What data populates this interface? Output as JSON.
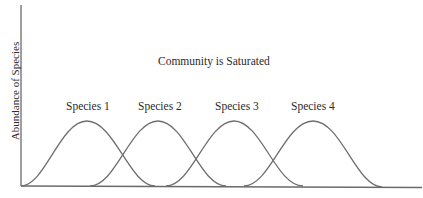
{
  "diagram": {
    "title": "Community is Saturated",
    "y_axis_label": "Abundance of Species",
    "x_axis_label": "",
    "species": [
      {
        "label": "Species 1"
      },
      {
        "label": "Species 2"
      },
      {
        "label": "Species 3"
      },
      {
        "label": "Species 4"
      }
    ],
    "colors": {
      "curve": "#6e6e6e",
      "axis": "#6a6a6a",
      "text": "#2b2b2b"
    }
  }
}
